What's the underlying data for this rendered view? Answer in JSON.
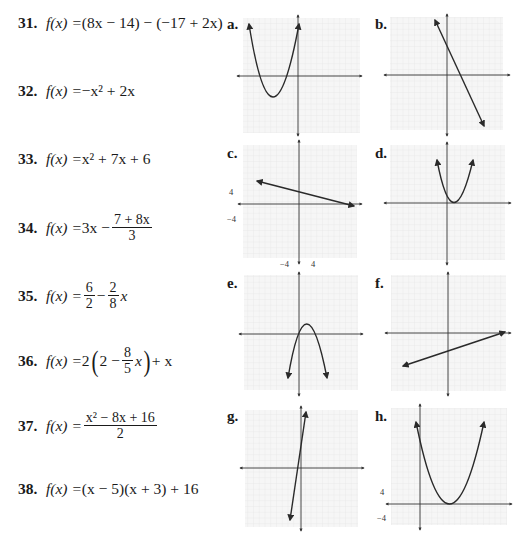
{
  "problems": [
    {
      "num": "31.",
      "lhs": "f(x) = ",
      "expr": "(8x − 14) − (−17 + 2x)"
    },
    {
      "num": "32.",
      "lhs": "f(x) = ",
      "expr": "−x² + 2x"
    },
    {
      "num": "33.",
      "lhs": "f(x) = ",
      "expr": "x² + 7x + 6"
    },
    {
      "num": "34.",
      "lhs": "f(x) = ",
      "expr_pre": "3x − ",
      "frac_top": "7 + 8x",
      "frac_bot": "3"
    },
    {
      "num": "35.",
      "lhs": "f(x) = ",
      "frac1_top": "6",
      "frac1_bot": "2",
      "minus": " − ",
      "frac2_top": "2",
      "frac2_bot": "8",
      "tail": "x"
    },
    {
      "num": "36.",
      "lhs": "f(x) = ",
      "pre": "2",
      "inner_pre": "2 − ",
      "frac_top": "8",
      "frac_bot": "5",
      "inner_tail": "x",
      "tail": " + x"
    },
    {
      "num": "37.",
      "lhs": "f(x) = ",
      "frac_top": "x² − 8x + 16",
      "frac_bot": "2"
    },
    {
      "num": "38.",
      "lhs": "f(x) = ",
      "expr": "(x − 5)(x + 3) + 16"
    }
  ],
  "graphs": [
    {
      "label": "a.",
      "type": "parabola",
      "description": "upward parabola, vertex in third quadrant, both arms up"
    },
    {
      "label": "b.",
      "type": "line",
      "description": "steep negative slope line"
    },
    {
      "label": "c.",
      "type": "line",
      "description": "shallow negative slope line",
      "ticks": {
        "y_pos": "4",
        "y_neg": "−4",
        "x_neg": "−4",
        "x_pos": "4"
      }
    },
    {
      "label": "d.",
      "type": "parabola",
      "description": "narrow upward parabola, vertex just right of origin on x-axis"
    },
    {
      "label": "e.",
      "type": "parabola",
      "description": "downward parabola, vertex just above x-axis right of origin"
    },
    {
      "label": "f.",
      "type": "line",
      "description": "shallow positive slope line, negative y-intercept"
    },
    {
      "label": "g.",
      "type": "line",
      "description": "very steep positive slope line"
    },
    {
      "label": "h.",
      "type": "parabola",
      "description": "wide upward parabola, vertex on x-axis right of y-axis",
      "ticks": {
        "y_pos": "4",
        "y_neg": "−4"
      }
    }
  ],
  "colors": {
    "grid": "#d8d8d8",
    "axis": "#333333",
    "curve": "#2a2a2a",
    "text": "#1a1a1a"
  }
}
